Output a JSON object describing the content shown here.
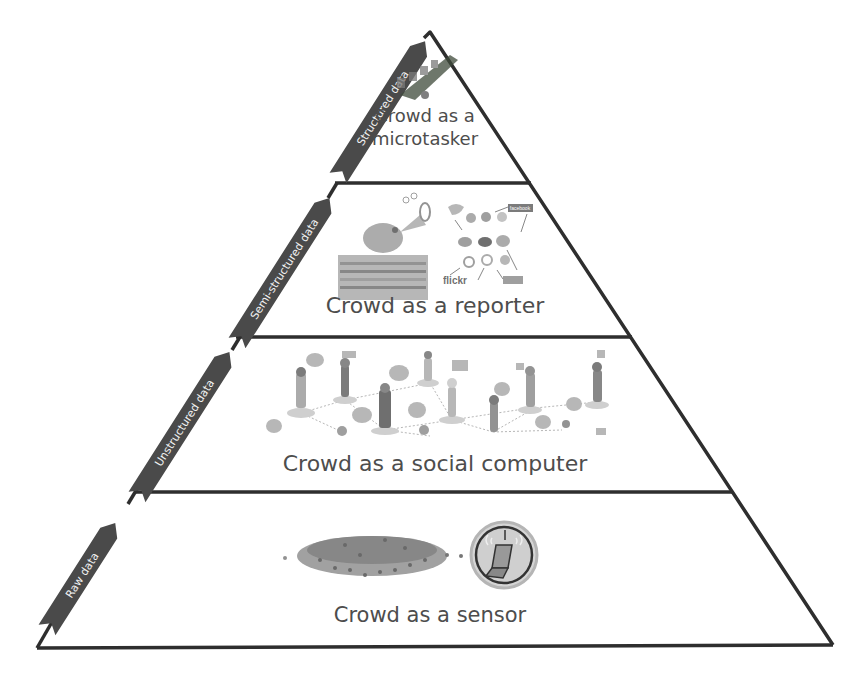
{
  "diagram": {
    "type": "pyramid",
    "colors": {
      "outline": "#2e2e2e",
      "arrow_fill": "#4a4a4a",
      "arrow_text": "#f2f2f2",
      "label_text": "#4d4d4d",
      "background": "#ffffff"
    },
    "layers": [
      {
        "id": "microtasker",
        "label_line1": "Crowd as a",
        "label_line2": "microtasker",
        "icon": "crowd-microtasker-icon"
      },
      {
        "id": "reporter",
        "label": "Crowd as a reporter",
        "icons": [
          "bird-megaphone-icon",
          "social-network-icon"
        ],
        "social_labels": {
          "facebook": "facebook",
          "flickr": "flickr",
          "youtube": "YouTube"
        }
      },
      {
        "id": "social-computer",
        "label": "Crowd as a social computer",
        "icon": "connected-people-icon"
      },
      {
        "id": "sensor",
        "label": "Crowd as a sensor",
        "icons": [
          "crowd-icon",
          "mobile-phone-signal-icon"
        ]
      }
    ],
    "data_arrows": [
      {
        "label": "Structured data"
      },
      {
        "label": "Semi-structured data"
      },
      {
        "label": "Unstructured data"
      },
      {
        "label": "Raw data"
      }
    ]
  }
}
